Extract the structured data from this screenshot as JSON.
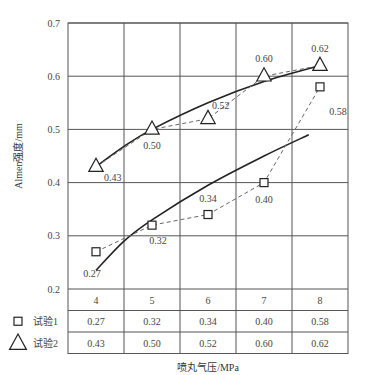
{
  "chart_data": {
    "type": "line",
    "title": "",
    "xlabel": "喷丸气压/MPa",
    "ylabel": "Almen强度/mm",
    "categories": [
      "4",
      "5",
      "6",
      "7",
      "8"
    ],
    "x": [
      4,
      5,
      6,
      7,
      8
    ],
    "ylim": [
      0.2,
      0.7
    ],
    "yticks": [
      "0.7",
      "0.6",
      "0.5",
      "0.4",
      "0.3",
      "0.2"
    ],
    "grid": true,
    "legend_position": "table-below",
    "series": [
      {
        "name": "试验1",
        "marker": "square",
        "line": "dashed",
        "values": [
          0.27,
          0.32,
          0.34,
          0.4,
          0.58
        ],
        "labels": [
          "0.27",
          "0.32",
          "0.34",
          "0.40",
          "0.58"
        ]
      },
      {
        "name": "试验2",
        "marker": "triangle",
        "line": "dashed",
        "values": [
          0.43,
          0.5,
          0.52,
          0.6,
          0.62
        ],
        "labels": [
          "0.43",
          "0.50",
          "0.52",
          "0.60",
          "0.62"
        ]
      }
    ],
    "trend_lines": [
      {
        "for": "试验1",
        "style": "solid",
        "points": [
          [
            4.0,
            0.235
          ],
          [
            4.5,
            0.29
          ],
          [
            5.0,
            0.33
          ],
          [
            6.0,
            0.395
          ],
          [
            7.0,
            0.45
          ],
          [
            7.8,
            0.49
          ]
        ]
      },
      {
        "for": "试验2",
        "style": "solid",
        "points": [
          [
            4.0,
            0.43
          ],
          [
            4.5,
            0.468
          ],
          [
            5.0,
            0.5
          ],
          [
            6.0,
            0.55
          ],
          [
            7.0,
            0.59
          ],
          [
            8.0,
            0.62
          ]
        ]
      }
    ],
    "table": {
      "header": [
        "4",
        "5",
        "6",
        "7",
        "8"
      ],
      "rows": [
        {
          "legend": "试验1",
          "marker": "square",
          "values": [
            "0.27",
            "0.32",
            "0.34",
            "0.40",
            "0.58"
          ]
        },
        {
          "legend": "试验2",
          "marker": "triangle",
          "values": [
            "0.43",
            "0.50",
            "0.52",
            "0.60",
            "0.62"
          ]
        }
      ]
    }
  },
  "colors": {
    "line": "#222222",
    "grid": "#555555",
    "dashed": "#666666",
    "text": "#333333"
  }
}
